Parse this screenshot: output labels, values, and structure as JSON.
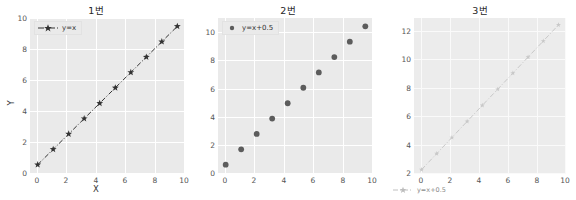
{
  "figure": {
    "background": "#ffffff",
    "axes_background": "#eaeaea",
    "grid_color": "#ffffff",
    "width": 576,
    "height": 200
  },
  "chart_data": [
    {
      "type": "line",
      "title": "1번",
      "xlabel": "X",
      "ylabel": "Y",
      "xlim": [
        -0.55,
        10.55
      ],
      "ylim": [
        -0.6,
        10.6
      ],
      "xticks": [
        0,
        2,
        4,
        6,
        8,
        10
      ],
      "yticks": [
        0,
        2,
        4,
        6,
        8,
        10
      ],
      "grid": true,
      "legend_position": "upper left",
      "series": [
        {
          "name": "y=x",
          "color": "#333333",
          "marker": "star",
          "linestyle": "dashdot",
          "x": [
            0.0,
            1.11,
            2.22,
            3.33,
            4.44,
            5.56,
            6.67,
            7.78,
            8.89,
            10.0
          ],
          "y": [
            0.0,
            1.11,
            2.22,
            3.33,
            4.44,
            5.56,
            6.67,
            7.78,
            8.89,
            10.0
          ]
        }
      ]
    },
    {
      "type": "scatter",
      "title": "2번",
      "xlabel": "",
      "ylabel": "",
      "xlim": [
        -0.55,
        10.55
      ],
      "ylim": [
        -0.1,
        11.1
      ],
      "xticks": [
        0,
        2,
        4,
        6,
        8,
        10
      ],
      "yticks": [
        0,
        2,
        4,
        6,
        8,
        10
      ],
      "grid": true,
      "legend_position": "upper left",
      "series": [
        {
          "name": "y=x+0.5",
          "color": "#5c5c5c",
          "marker": "circle",
          "linestyle": "none",
          "x": [
            0.0,
            1.11,
            2.22,
            3.33,
            4.44,
            5.56,
            6.67,
            7.78,
            8.89,
            10.0
          ],
          "y": [
            0.5,
            1.61,
            2.72,
            3.83,
            4.94,
            6.06,
            7.17,
            8.28,
            9.39,
            10.5
          ]
        }
      ]
    },
    {
      "type": "line",
      "title": "3번",
      "xlabel": "",
      "ylabel": "",
      "xlim": [
        -0.55,
        10.55
      ],
      "ylim": [
        1.9,
        12.6
      ],
      "xticks": [
        0,
        2,
        4,
        6,
        8,
        10
      ],
      "yticks": [
        2,
        4,
        6,
        8,
        10,
        12
      ],
      "grid": true,
      "legend_position": "below axes",
      "series": [
        {
          "name": "y=x+0.5",
          "color": "#c8c8c8",
          "marker": "star",
          "linestyle": "dashdot",
          "x": [
            0.0,
            1.11,
            2.22,
            3.33,
            4.44,
            5.56,
            6.67,
            7.78,
            8.89,
            10.0
          ],
          "y": [
            2.13,
            3.24,
            4.35,
            5.46,
            6.57,
            7.68,
            8.79,
            9.9,
            11.01,
            12.12
          ]
        }
      ]
    }
  ],
  "subplots": [
    {
      "title": "1번",
      "xlabel": "X",
      "ylabel": "Y",
      "legend_label": "y=x",
      "xticklabels": [
        "0",
        "2",
        "4",
        "6",
        "8",
        "10"
      ],
      "yticklabels": [
        "0",
        "2",
        "4",
        "6",
        "8",
        "10"
      ]
    },
    {
      "title": "2번",
      "xlabel": "",
      "ylabel": "",
      "legend_label": "y=x+0.5",
      "xticklabels": [
        "0",
        "2",
        "4",
        "6",
        "8",
        "10"
      ],
      "yticklabels": [
        "0",
        "2",
        "4",
        "6",
        "8",
        "10"
      ]
    },
    {
      "title": "3번",
      "xlabel": "",
      "ylabel": "",
      "legend_label": "y=x+0.5",
      "xticklabels": [
        "0",
        "2",
        "4",
        "6",
        "8",
        "10"
      ],
      "yticklabels": [
        "2",
        "4",
        "6",
        "8",
        "10",
        "12"
      ]
    }
  ]
}
